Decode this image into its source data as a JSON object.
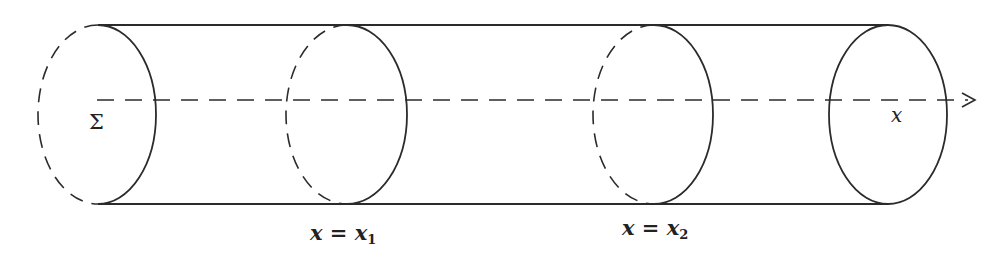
{
  "diagram": {
    "type": "cylinder-cross-sections",
    "colors": {
      "stroke": "#2b2b2b",
      "background": "#ffffff"
    },
    "cylinder": {
      "top_y": 25,
      "bottom_y": 204,
      "left_x": 98,
      "right_x": 888
    },
    "axis": {
      "y": 100,
      "start_x": 97,
      "end_x": 975,
      "label": "x",
      "style": "dashed",
      "arrow": true
    },
    "sections": [
      {
        "id": "sigma",
        "cx": 98,
        "rx": 60,
        "label": "Σ",
        "left_half": "dashed",
        "right_half": "solid"
      },
      {
        "id": "x1",
        "cx": 347,
        "rx": 60,
        "label_var": "x",
        "label_eq": "=",
        "label_rhs": "x",
        "label_sub": "1",
        "left_half": "dashed",
        "right_half": "solid"
      },
      {
        "id": "x2",
        "cx": 654,
        "rx": 60,
        "label_var": "x",
        "label_eq": "=",
        "label_rhs": "x",
        "label_sub": "2",
        "left_half": "dashed",
        "right_half": "solid"
      },
      {
        "id": "end",
        "cx": 888,
        "rx": 59,
        "left_half": "solid",
        "right_half": "solid"
      }
    ]
  }
}
